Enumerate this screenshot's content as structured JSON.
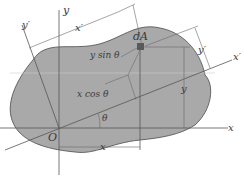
{
  "figure": {
    "colors": {
      "area_fill": "#a9a9a9",
      "area_stroke": "#4a4a4a",
      "line": "#555555",
      "element": "#5a5a5a",
      "text": "#3a3a3a"
    },
    "labels": {
      "x_axis": "x",
      "y_axis": "y",
      "x_prime_axis": "x′",
      "y_prime_axis": "y′",
      "x_prime_dim": "x′",
      "y_prime_dim": "y′",
      "y_prime_dim_top": "y′",
      "element": "dA",
      "origin": "O",
      "angle": "θ",
      "y_sin": "y sin θ",
      "x_cos": "x cos θ",
      "x_dim": "x",
      "y_dim": "y"
    },
    "rotation_angle_deg": 20
  }
}
